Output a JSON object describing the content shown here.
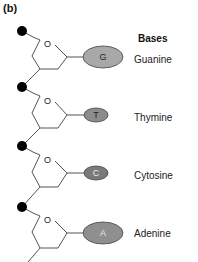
{
  "figure": {
    "panel_label": "(b)",
    "heading": "Bases",
    "ring_oxygen_label": "O",
    "units": [
      {
        "letter": "G",
        "name": "Guanine",
        "fill": "#a8a8a8",
        "letter_color": "#222222",
        "size": "large"
      },
      {
        "letter": "T",
        "name": "Thymine",
        "fill": "#8c8c8c",
        "letter_color": "#222222",
        "size": "small"
      },
      {
        "letter": "C",
        "name": "Cytosine",
        "fill": "#7a7a7a",
        "letter_color": "#e8e8e8",
        "size": "small"
      },
      {
        "letter": "A",
        "name": "Adenine",
        "fill": "#8f8f8f",
        "letter_color": "#e8e8e8",
        "size": "large"
      }
    ],
    "phosphate_color": "#000000",
    "line_color": "#555555"
  }
}
